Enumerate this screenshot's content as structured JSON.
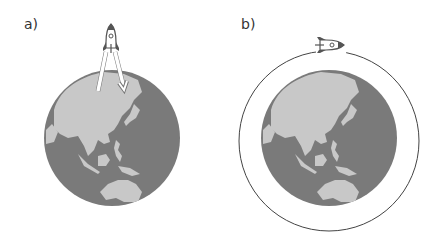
{
  "panels": [
    {
      "label": "a)",
      "description": "Rocket launching from Earth, arrows to/from East Asia"
    },
    {
      "label": "b)",
      "description": "Rocket orbiting around Earth"
    }
  ],
  "colors": {
    "ocean": "#7a7a7a",
    "land": "#c8c8c8",
    "orbit": "#444444",
    "rocket": "#555555"
  }
}
